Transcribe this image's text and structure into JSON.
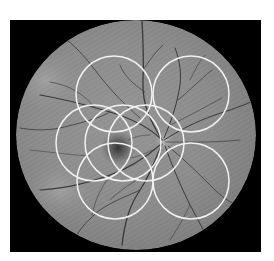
{
  "image": {
    "subject": "retinal fundus photograph (grayscale) with circular region overlays",
    "background_color": "#ffffff",
    "frame": {
      "x": 10,
      "y": 20,
      "width": 251,
      "height": 232,
      "color": "#000000"
    },
    "fundus": {
      "cx": 136,
      "cy": 135,
      "rx": 120,
      "ry": 115,
      "base_color": "#8c8c8c"
    },
    "macula": {
      "cx": 118,
      "cy": 148,
      "r": 16,
      "color": "#2e2e2e"
    },
    "optic_disc": {
      "cx": 164,
      "cy": 141,
      "r": 9,
      "color": "#b8b8b8"
    },
    "vessel_color": "#3a3a3a",
    "overlay_color": "#f2f2f2"
  },
  "overlay_circles": [
    {
      "id": "top-left",
      "cx": 114,
      "cy": 94,
      "r": 38
    },
    {
      "id": "top-right",
      "cx": 191,
      "cy": 94,
      "r": 38
    },
    {
      "id": "middle-left",
      "cx": 94,
      "cy": 143,
      "r": 38
    },
    {
      "id": "middle-center",
      "cx": 123,
      "cy": 143,
      "r": 38
    },
    {
      "id": "middle-right",
      "cx": 146,
      "cy": 143,
      "r": 38
    },
    {
      "id": "bottom-left",
      "cx": 115,
      "cy": 181,
      "r": 38
    },
    {
      "id": "bottom-right",
      "cx": 191,
      "cy": 181,
      "r": 38
    }
  ]
}
